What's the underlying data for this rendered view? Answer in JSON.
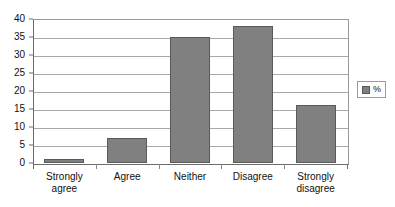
{
  "chart_data": {
    "type": "bar",
    "title": "",
    "subtitle": "",
    "xlabel": "",
    "ylabel": "",
    "categories": [
      "Strongly agree",
      "Agree",
      "Neither",
      "Disagree",
      "Strongly disagree"
    ],
    "values": [
      1,
      7,
      35,
      38,
      16
    ],
    "series": [
      {
        "name": "%",
        "values": [
          1,
          7,
          35,
          38,
          16
        ]
      }
    ],
    "ylim": [
      0,
      40
    ],
    "ytick_step": 5,
    "yticks": [
      0,
      5,
      10,
      15,
      20,
      25,
      30,
      35,
      40
    ],
    "ytick_labels": [
      "0",
      "5",
      "10",
      "15",
      "20",
      "25",
      "30",
      "35",
      "40"
    ],
    "grid": true,
    "grid_axis": "y",
    "legend": {
      "position": "right",
      "entries": [
        {
          "label": "%",
          "color": "#808080"
        }
      ]
    },
    "colors": {
      "bar": "#808080",
      "bar_edge": "#5a5a5a",
      "grid": "#a8a8a8",
      "axis": "#6b6b6b",
      "background": "#ffffff",
      "text": "#111111"
    }
  }
}
